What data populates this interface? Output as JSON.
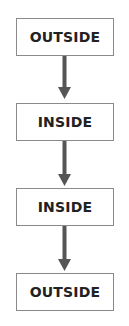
{
  "diagram": {
    "type": "flowchart",
    "direction": "top-to-bottom",
    "nodes": [
      {
        "id": "n1",
        "label": "OUTSIDE"
      },
      {
        "id": "n2",
        "label": "INSIDE"
      },
      {
        "id": "n3",
        "label": "INSIDE"
      },
      {
        "id": "n4",
        "label": "OUTSIDE"
      }
    ],
    "edges": [
      {
        "from": "n1",
        "to": "n2"
      },
      {
        "from": "n2",
        "to": "n3"
      },
      {
        "from": "n3",
        "to": "n4"
      }
    ],
    "colors": {
      "box_border": "#8a8a8a",
      "text": "#222222",
      "arrow": "#555555"
    }
  }
}
